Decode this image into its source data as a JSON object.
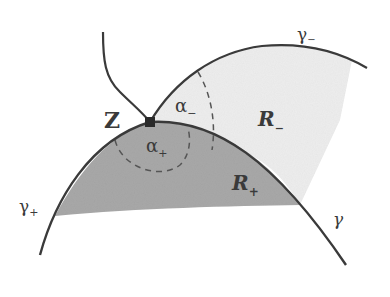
{
  "diagram": {
    "title": "",
    "colors": {
      "background": "#ffffff",
      "curve": "#3a3a3a",
      "region_plus": "#a9a9a9",
      "region_minus": "#ececec",
      "dashed": "#555555"
    },
    "point": {
      "label": "Z"
    },
    "angles": {
      "alpha_minus": {
        "symbol": "α",
        "sub": "−"
      },
      "alpha_plus": {
        "symbol": "α",
        "sub": "+"
      }
    },
    "regions": {
      "r_minus": {
        "symbol": "R",
        "sub": "−"
      },
      "r_plus": {
        "symbol": "R",
        "sub": "+"
      }
    },
    "curves": {
      "gamma_minus": {
        "symbol": "γ",
        "sub": "−"
      },
      "gamma_plus": {
        "symbol": "γ",
        "sub": "+"
      },
      "gamma": {
        "symbol": "γ"
      }
    }
  }
}
